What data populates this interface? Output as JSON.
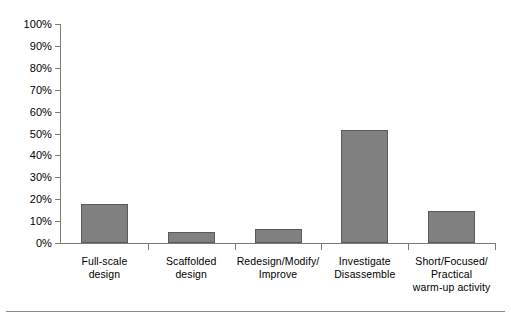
{
  "chart_data": {
    "type": "bar",
    "title": "",
    "subtitle": "",
    "xlabel": "",
    "ylabel": "",
    "categories": [
      "Full-scale\ndesign",
      "Scaffolded\ndesign",
      "Redesign/Modify/\nImprove",
      "Investigate\nDisassemble",
      "Short/Focused/\nPractical\nwarm-up activity"
    ],
    "values": [
      18,
      5,
      6.5,
      51.5,
      14.5
    ],
    "value_labels": [
      "18%",
      "5%",
      "6.5%",
      "51.5%",
      "14.5%"
    ],
    "ylim": [
      0,
      100
    ],
    "ytick_values": [
      0,
      10,
      20,
      30,
      40,
      50,
      60,
      70,
      80,
      90,
      100
    ],
    "ytick_labels": [
      "0%",
      "10%",
      "20%",
      "30%",
      "40%",
      "50%",
      "60%",
      "70%",
      "80%",
      "90%",
      "100%"
    ],
    "grid": false,
    "legend": "none",
    "series": [
      {
        "name": "Percentage of responses",
        "values": [
          18,
          5,
          6.5,
          51.5,
          14.5
        ],
        "color": "#808080"
      }
    ]
  },
  "figure": {
    "bar_fill_color": "#808080",
    "bar_edge_color": "#5a5a5a",
    "axis_color": "#7b7b7b",
    "background_color": "#ffffff",
    "text_color": "#000000"
  },
  "caption": {
    "rule": "",
    "text": ""
  }
}
